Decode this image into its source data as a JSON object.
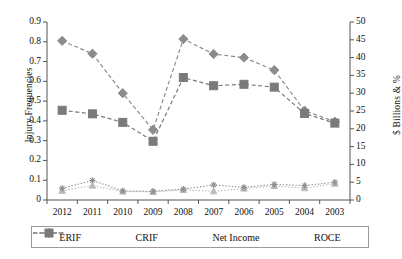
{
  "chart_data": {
    "type": "line",
    "title": "",
    "xlabel": "",
    "ylabel": "Injury Frequencies",
    "y2label": "$ Billions & %",
    "categories": [
      "2012",
      "2011",
      "2010",
      "2009",
      "2008",
      "2007",
      "2006",
      "2005",
      "2004",
      "2003"
    ],
    "ylim": [
      0,
      0.9
    ],
    "y2lim": [
      0,
      50
    ],
    "yticks": [
      "0",
      "0.1",
      "0.2",
      "0.3",
      "0.4",
      "0.5",
      "0.6",
      "0.7",
      "0.8",
      "0.9"
    ],
    "y2ticks": [
      "0",
      "5",
      "10",
      "15",
      "20",
      "25",
      "30",
      "35",
      "40",
      "45",
      "50"
    ],
    "grid": false,
    "legend_position": "bottom",
    "series": [
      {
        "name": "ERIF",
        "axis": "left",
        "marker": "triangle",
        "line_style": "dotted",
        "color": "#b9b9b9",
        "values": [
          0.047,
          0.073,
          0.043,
          0.041,
          0.051,
          0.044,
          0.058,
          0.071,
          0.06,
          0.083
        ]
      },
      {
        "name": "CRIF",
        "axis": "left",
        "marker": "star",
        "line_style": "dotted",
        "color": "#8f8f8f",
        "values": [
          0.059,
          0.099,
          0.046,
          0.044,
          0.055,
          0.076,
          0.064,
          0.079,
          0.073,
          0.09
        ]
      },
      {
        "name": "Net Income",
        "axis": "right",
        "marker": "diamond",
        "line_style": "dashed",
        "color": "#8c8c8c",
        "values": [
          44.7,
          41.1,
          30.0,
          19.7,
          45.2,
          41.0,
          40.0,
          36.5,
          25.1,
          22.0
        ]
      },
      {
        "name": "ROCE",
        "axis": "right",
        "marker": "square",
        "line_style": "dashed",
        "color": "#7a7a7a",
        "values": [
          25.2,
          24.2,
          21.8,
          16.5,
          34.4,
          32.1,
          32.5,
          31.7,
          24.3,
          21.6
        ]
      }
    ],
    "legend": [
      "ERIF",
      "CRIF",
      "Net Income",
      "ROCE"
    ]
  }
}
